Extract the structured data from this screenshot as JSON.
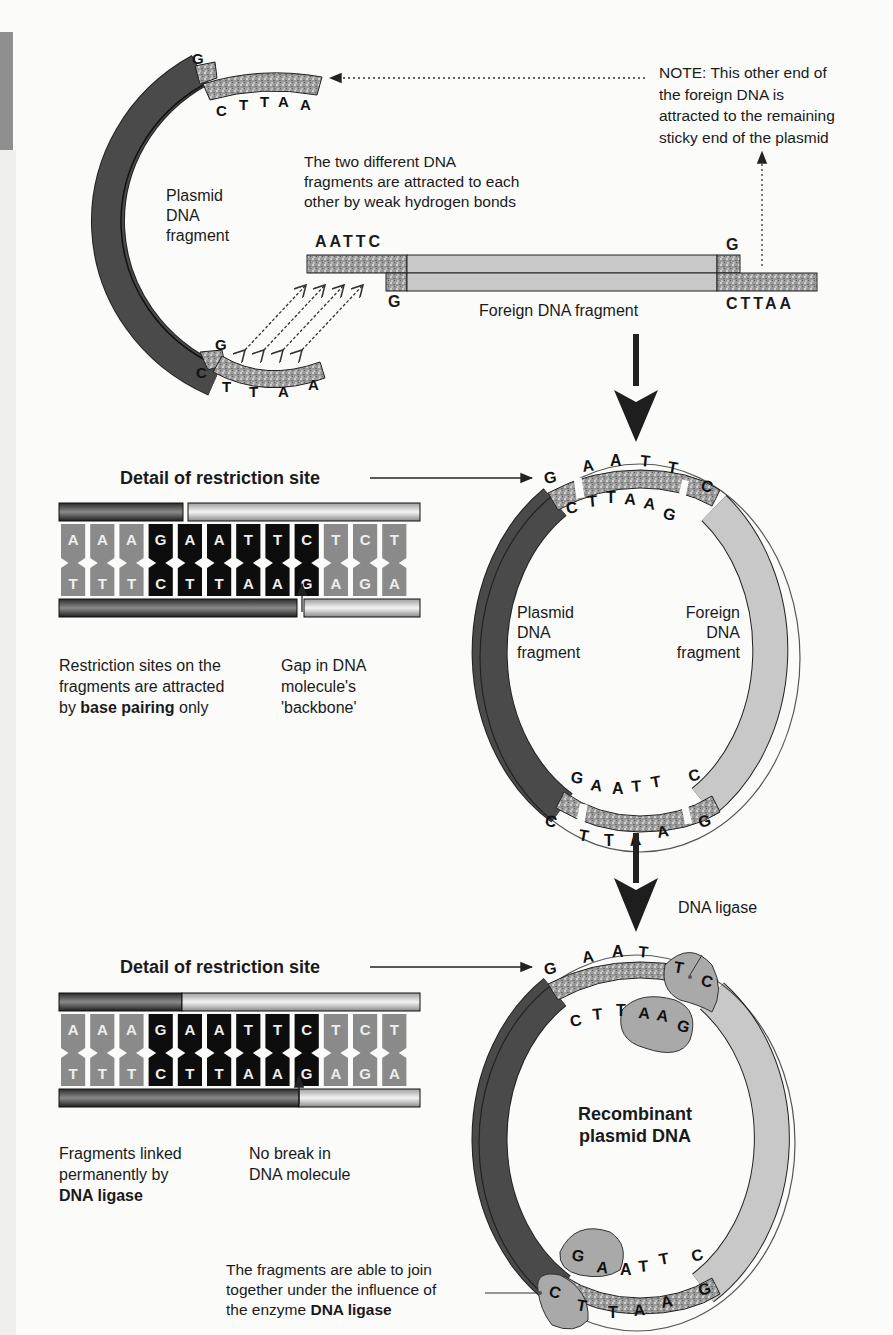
{
  "colors": {
    "plasmid": "#4a4a4a",
    "foreign": "#c4c4c4",
    "sticky": "#9a9a9a",
    "ligase": "#a9a9a9",
    "background": "#fbfbfa",
    "base_dark": "#0d0d0d",
    "base_gray": "#8a8a8a"
  },
  "stage1": {
    "plasmid_label": [
      "Plasmid",
      "DNA",
      "fragment"
    ],
    "top_end": {
      "top_base": "G",
      "bottom_bases": [
        "C",
        "T",
        "T",
        "A",
        "A"
      ]
    },
    "bottom_end": {
      "top_base": "G",
      "bottom_bases": [
        "C",
        "T",
        "T",
        "A",
        "A"
      ]
    },
    "foreign_left_end": {
      "top_bases": "AATTC",
      "bottom_base": "G"
    },
    "foreign_right_end": {
      "top_base": "G",
      "bottom_bases": "CTTAA"
    },
    "foreign_label": "Foreign DNA fragment",
    "hbond_note": [
      "The two different DNA",
      "fragments are attracted to each",
      "other by weak hydrogen bonds"
    ],
    "note": [
      "NOTE: This other end of",
      "the foreign DNA is",
      "attracted to the remaining",
      "sticky end of the plasmid"
    ],
    "hbond_arrow_count": 4
  },
  "stage2": {
    "detail_title": "Detail of restriction site",
    "top_strand": [
      "A",
      "A",
      "A",
      "G",
      "A",
      "A",
      "T",
      "T",
      "C",
      "T",
      "C",
      "T"
    ],
    "bottom_strand": [
      "T",
      "T",
      "T",
      "C",
      "T",
      "T",
      "A",
      "A",
      "G",
      "A",
      "G",
      "A"
    ],
    "caption_left": {
      "pre": "Restriction sites on the",
      "line2": "fragments are attracted",
      "by": "by ",
      "bold": "base pairing",
      "post": " only"
    },
    "caption_right": [
      "Gap in DNA",
      "molecule's",
      "'backbone'"
    ],
    "circle": {
      "top_outer": [
        "G",
        "A",
        "A",
        "T",
        "T",
        "C"
      ],
      "top_inner": [
        "C",
        "T",
        "T",
        "A",
        "A",
        "G"
      ],
      "bottom_outer": [
        "G",
        "A",
        "A",
        "T",
        "T",
        "C"
      ],
      "bottom_inner": [
        "C",
        "T",
        "T",
        "A",
        "A",
        "G"
      ],
      "left_label": [
        "Plasmid",
        "DNA",
        "fragment"
      ],
      "right_label": [
        "Foreign",
        "DNA",
        "fragment"
      ]
    }
  },
  "stage3": {
    "detail_title": "Detail of restriction site",
    "top_strand": [
      "A",
      "A",
      "A",
      "G",
      "A",
      "A",
      "T",
      "T",
      "C",
      "T",
      "C",
      "T"
    ],
    "bottom_strand": [
      "T",
      "T",
      "T",
      "C",
      "T",
      "T",
      "A",
      "A",
      "G",
      "A",
      "G",
      "A"
    ],
    "caption_left": [
      "Fragments linked",
      "permanently by",
      "DNA ligase"
    ],
    "caption_right": [
      "No break in",
      "DNA molecule"
    ],
    "ligase_label": "DNA ligase",
    "center_label": [
      "Recombinant",
      "plasmid DNA"
    ],
    "bottom_caption": {
      "line1": "The fragments are able to join",
      "line2": "together under the influence of",
      "pre": "the enzyme ",
      "bold": "DNA ligase"
    },
    "circle": {
      "top_outer": [
        "G",
        "A",
        "A",
        "T",
        "T",
        "C"
      ],
      "top_inner": [
        "C",
        "T",
        "T",
        "A",
        "A",
        "G"
      ],
      "bottom_outer": [
        "G",
        "A",
        "A",
        "T",
        "T",
        "C"
      ],
      "bottom_inner": [
        "C",
        "T",
        "T",
        "A",
        "A",
        "G"
      ]
    }
  }
}
